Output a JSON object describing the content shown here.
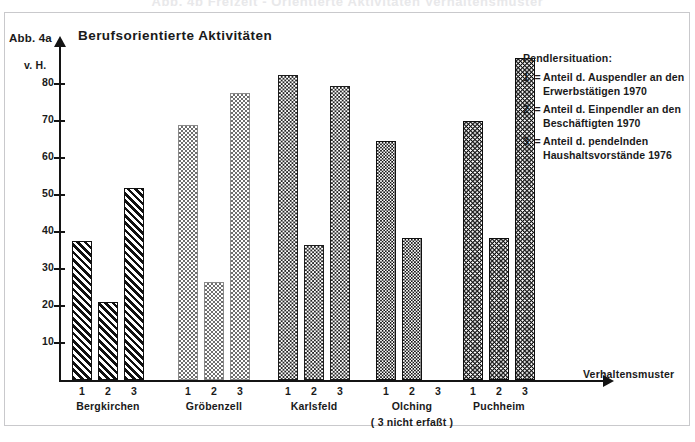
{
  "cut_title": "Abb. 4b   Frelzeit - Orientierte Aktivitäten Verhaltensmuster",
  "figure_label": "Abb. 4a",
  "legend": {
    "title": "Pendlersituation:",
    "entries": [
      {
        "key": "1",
        "eq": "=",
        "text": "Anteil d. Auspendler an den Erwerbstätigen 1970"
      },
      {
        "key": "2",
        "eq": "=",
        "text": "Anteil d. Einpendler an den Beschäftigten 1970"
      },
      {
        "key": "3",
        "eq": "=",
        "text": "Anteil d. pendelnden Haushaltsvorstände 1976"
      }
    ]
  },
  "chart_data": {
    "type": "bar",
    "title": "Berufsorientierte Aktivitäten",
    "xlabel": "Verhaltensmuster",
    "ylabel": "v. H.",
    "ylim": [
      0,
      90
    ],
    "yticks": [
      10,
      20,
      30,
      40,
      50,
      60,
      70,
      80
    ],
    "grid": false,
    "series_labels": [
      "1",
      "2",
      "3"
    ],
    "categories": [
      "Bergkirchen",
      "Gröbenzell",
      "Karlsfeld",
      "Olching",
      "Puchheim"
    ],
    "category_notes": [
      "",
      "",
      "",
      "( 3 nicht erfaßt )",
      ""
    ],
    "groups": [
      {
        "name": "Bergkirchen",
        "pattern": "diagonal-hatch",
        "bars": [
          {
            "label": "1",
            "value": 37.5
          },
          {
            "label": "2",
            "value": 21.0
          },
          {
            "label": "3",
            "value": 52.0
          }
        ]
      },
      {
        "name": "Gröbenzell",
        "pattern": "light-check",
        "bars": [
          {
            "label": "1",
            "value": 69.0
          },
          {
            "label": "2",
            "value": 26.5
          },
          {
            "label": "3",
            "value": 77.5
          }
        ]
      },
      {
        "name": "Karlsfeld",
        "pattern": "mid-check",
        "bars": [
          {
            "label": "1",
            "value": 82.5
          },
          {
            "label": "2",
            "value": 36.5
          },
          {
            "label": "3",
            "value": 79.5
          }
        ]
      },
      {
        "name": "Olching",
        "pattern": "dark-check",
        "bars": [
          {
            "label": "1",
            "value": 64.5
          },
          {
            "label": "2",
            "value": 38.5
          },
          {
            "label": "3",
            "value": null
          }
        ]
      },
      {
        "name": "Puchheim",
        "pattern": "dots",
        "bars": [
          {
            "label": "1",
            "value": 70.0
          },
          {
            "label": "2",
            "value": 38.5
          },
          {
            "label": "3",
            "value": 87.0
          }
        ]
      }
    ]
  },
  "colors": {
    "ink": "#141414",
    "frame": "#c9c9cc",
    "background": "#ffffff"
  }
}
